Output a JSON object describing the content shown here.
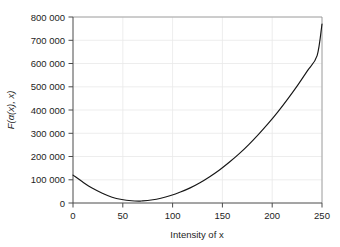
{
  "chart_data": {
    "type": "line",
    "title": "",
    "subtitle": "",
    "xlabel": "Intensity of x",
    "ylabel": "F(α(x), x)",
    "xlim": [
      0,
      255
    ],
    "ylim": [
      0,
      800000
    ],
    "grid": true,
    "legend": null,
    "xticks": [
      0,
      50,
      100,
      150,
      200,
      250
    ],
    "yticks": [
      0,
      100000,
      200000,
      300000,
      400000,
      500000,
      600000,
      700000,
      800000
    ],
    "xtick_labels": [
      "0",
      "50",
      "100",
      "150",
      "200",
      "250"
    ],
    "ytick_labels": [
      "0",
      "100 000",
      "200 000",
      "300 000",
      "400 000",
      "500 000",
      "600 000",
      "700 000",
      "800 000"
    ],
    "series": [
      {
        "name": "F(α(x), x)",
        "color": "#161616",
        "x": [
          0,
          10,
          20,
          30,
          40,
          50,
          60,
          68,
          70,
          80,
          90,
          100,
          110,
          120,
          130,
          140,
          150,
          160,
          170,
          180,
          190,
          200,
          210,
          220,
          230,
          240,
          250,
          255
        ],
        "values": [
          120000,
          90000,
          63000,
          42000,
          25000,
          15000,
          9500,
          8000,
          8500,
          13000,
          20500,
          32000,
          47000,
          65000,
          87000,
          113000,
          142000,
          175000,
          211000,
          251000,
          295000,
          342000,
          393000,
          448000,
          506000,
          568000,
          634000,
          770000
        ]
      }
    ],
    "annotations": [
      {
        "text": "minimum",
        "x": 68,
        "y": 8000
      }
    ],
    "axis_color": "#4a4a4a",
    "grid_color": "#e9e9e9",
    "background_color": "#ffffff"
  },
  "figure": {
    "xlabel": "Intensity of x",
    "ylabel_full": "F(α(x), x)",
    "ylabel_parts": {
      "f": "F",
      "open": "(",
      "alpha": "α",
      "x1": "(x)",
      "comma": ", ",
      "x2": "x",
      "close": ")"
    }
  }
}
